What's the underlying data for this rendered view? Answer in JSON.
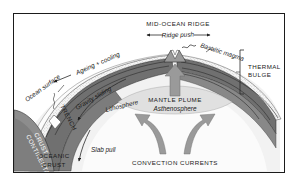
{
  "figure": {
    "title_internal": "Plate tectonics cross-section: mid-ocean ridge, subduction and mantle convection",
    "border_color": "#1b1b1b",
    "background": "#ffffff"
  },
  "labels": {
    "mid_ocean_ridge": "MID-OCEAN RIDGE",
    "ridge_push": "Ridge push",
    "basaltic_magma": "Basaltic magma",
    "thermal_bulge_line1": "THERMAL",
    "thermal_bulge_line2": "BULGE",
    "ageing_cooling": "Ageing + cooling",
    "ocean_surface": "Ocean surface",
    "trench": "TRENCH",
    "gravity_sliding": "Gravity sliding",
    "lithosphere": "Lithosphere",
    "asthenosphere": "Asthenosphere",
    "mantle_plume": "MANTLE PLUME",
    "continental_crust_line1": "CONTINENTAL",
    "continental_crust_line2": "CRUST",
    "oceanic_crust_line1": "OCEANIC",
    "oceanic_crust_line2": "CRUST",
    "slab_pull": "Slab pull",
    "convection_currents": "CONVECTION CURRENTS"
  },
  "colors": {
    "lithosphere_dark": "#6e6e6e",
    "lithosphere_mid": "#8a8a8a",
    "asthenosphere_light": "#ededed",
    "crust_stipple": "#f4f4f4",
    "water_light": "#fafafa",
    "arrow_gray": "#8d8d8d",
    "outline": "#2a2a2a",
    "text": "#1a1a1a"
  },
  "icons": {
    "ridge_push_left": "arrow-left-icon",
    "ridge_push_right": "arrow-right-icon",
    "plume_up": "arrow-up-icon",
    "convection_left": "curved-arrow-left-icon",
    "convection_right": "curved-arrow-right-icon",
    "slab_pull_down": "arrow-down-icon",
    "gravity_sliding_arrow": "arrow-down-left-icon",
    "ageing_cooling_arrow": "arrow-left-icon",
    "thermal_bulge_bracket": "bracket-icon",
    "wave_squiggle": "wave-icon"
  }
}
